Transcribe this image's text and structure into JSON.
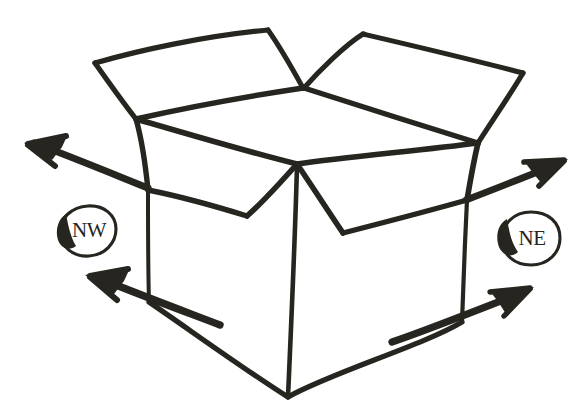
{
  "scene": {
    "title": "Open cardboard box with four directional arrows",
    "background_color": "#ffffff",
    "ink_color": "#26251f",
    "style": "hand-drawn marker sketch",
    "width": 588,
    "height": 417
  },
  "labels": [
    {
      "id": "nw",
      "text": "NW",
      "shape": "circle",
      "cx": 88,
      "cy": 231,
      "rx": 28,
      "ry": 25
    },
    {
      "id": "ne",
      "text": "NE",
      "shape": "circle",
      "cx": 530,
      "cy": 239,
      "rx": 29,
      "ry": 26
    }
  ],
  "arrows": [
    {
      "id": "upper-left",
      "direction": "northwest",
      "tip_x": 25,
      "tip_y": 145,
      "tail_x": 148,
      "tail_y": 188
    },
    {
      "id": "upper-right",
      "direction": "northeast",
      "tip_x": 566,
      "tip_y": 160,
      "tail_x": 466,
      "tail_y": 200
    },
    {
      "id": "lower-left",
      "direction": "northwest",
      "tip_x": 86,
      "tip_y": 275,
      "tail_x": 210,
      "tail_y": 318
    },
    {
      "id": "lower-right",
      "direction": "northeast",
      "tip_x": 533,
      "tip_y": 289,
      "tail_x": 430,
      "tail_y": 330
    }
  ],
  "box": {
    "center_vertex": {
      "x": 297,
      "y": 164
    },
    "bottom_vertex": {
      "x": 288,
      "y": 397
    },
    "left_corner": {
      "x": 148,
      "y": 190
    },
    "right_corner": {
      "x": 467,
      "y": 200
    },
    "flaps": [
      "back-left",
      "back-right",
      "front-left",
      "front-right"
    ]
  }
}
